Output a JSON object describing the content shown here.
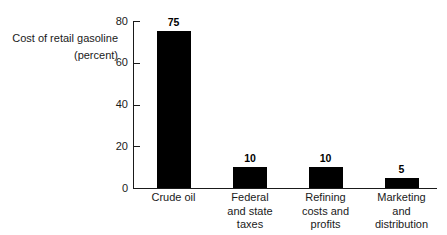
{
  "chart_data": {
    "type": "bar",
    "title": "",
    "subtitle": "",
    "xlabel": "",
    "ylabel": "Cost of retail gasoline (percent)",
    "ylabel_lines": [
      "Cost of retail gasoline",
      "(percent)"
    ],
    "categories": [
      "Crude oil",
      "Federal and state taxes",
      "Refining costs and profits",
      "Marketing and distribution"
    ],
    "category_lines": [
      [
        "Crude oil"
      ],
      [
        "Federal",
        "and state",
        "taxes"
      ],
      [
        "Refining",
        "costs and",
        "profits"
      ],
      [
        "Marketing",
        "and",
        "distribution"
      ]
    ],
    "values": [
      75,
      10,
      10,
      5
    ],
    "value_labels": [
      "75",
      "10",
      "10",
      "5"
    ],
    "ylim": [
      0,
      80
    ],
    "yticks": [
      0,
      20,
      40,
      60,
      80
    ],
    "ytick_labels": [
      "0",
      "20",
      "40",
      "60",
      "80"
    ],
    "grid": false,
    "legend": false,
    "bar_color": "#000000",
    "axis_color": "#1a1a1a",
    "background_color": "#ffffff"
  }
}
